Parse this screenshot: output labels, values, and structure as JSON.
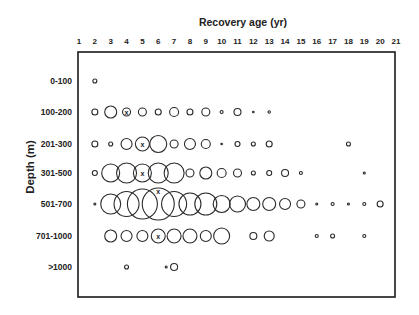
{
  "chart_data": {
    "type": "scatter",
    "subtype": "bubble",
    "title": "Recovery age (yr)",
    "xlabel": "Recovery age (yr)",
    "ylabel": "Depth (m)",
    "x_ticks": [
      "1",
      "2",
      "3",
      "4",
      "5",
      "6",
      "7",
      "8",
      "9",
      "10",
      "11",
      "12",
      "13",
      "14",
      "15",
      "16",
      "17",
      "18",
      "19",
      "20",
      "21"
    ],
    "xlim": [
      1,
      21
    ],
    "categories": [
      "0-100",
      "100-200",
      "201-300",
      "301-500",
      "501-700",
      "701-1000",
      ">1000"
    ],
    "grid": false,
    "legend": null,
    "size_unit": "approx. bubble diameter (px)",
    "marker_note": "x marks a highlighted bubble in several rows",
    "series": [
      {
        "name": "0-100",
        "points": [
          {
            "x": 2,
            "size": 4
          }
        ]
      },
      {
        "name": "100-200",
        "points": [
          {
            "x": 2,
            "size": 6
          },
          {
            "x": 3,
            "size": 12
          },
          {
            "x": 4,
            "size": 8,
            "marked": true
          },
          {
            "x": 5,
            "size": 8
          },
          {
            "x": 6,
            "size": 6
          },
          {
            "x": 7,
            "size": 9
          },
          {
            "x": 8,
            "size": 6
          },
          {
            "x": 9,
            "size": 8
          },
          {
            "x": 10,
            "size": 3
          },
          {
            "x": 11,
            "size": 7
          },
          {
            "x": 12,
            "size": 1.5
          },
          {
            "x": 13,
            "size": 2.5
          }
        ]
      },
      {
        "name": "201-300",
        "points": [
          {
            "x": 2,
            "size": 6
          },
          {
            "x": 3,
            "size": 4
          },
          {
            "x": 4,
            "size": 11
          },
          {
            "x": 5,
            "size": 14,
            "marked": true
          },
          {
            "x": 6,
            "size": 17
          },
          {
            "x": 7,
            "size": 8
          },
          {
            "x": 8,
            "size": 11
          },
          {
            "x": 9,
            "size": 9
          },
          {
            "x": 10,
            "size": 1.5
          },
          {
            "x": 11,
            "size": 5
          },
          {
            "x": 12,
            "size": 4
          },
          {
            "x": 13,
            "size": 6
          },
          {
            "x": 18,
            "size": 4
          }
        ]
      },
      {
        "name": "301-500",
        "points": [
          {
            "x": 2,
            "size": 5
          },
          {
            "x": 3,
            "size": 18
          },
          {
            "x": 4,
            "size": 20
          },
          {
            "x": 5,
            "size": 18,
            "marked": true
          },
          {
            "x": 6,
            "size": 20
          },
          {
            "x": 7,
            "size": 20
          },
          {
            "x": 8,
            "size": 8
          },
          {
            "x": 9,
            "size": 12
          },
          {
            "x": 10,
            "size": 9
          },
          {
            "x": 11,
            "size": 8
          },
          {
            "x": 12,
            "size": 4
          },
          {
            "x": 13,
            "size": 5
          },
          {
            "x": 14,
            "size": 7
          },
          {
            "x": 15,
            "size": 3
          },
          {
            "x": 19,
            "size": 2
          }
        ]
      },
      {
        "name": "501-700",
        "points": [
          {
            "x": 2,
            "size": 2
          },
          {
            "x": 3,
            "size": 20
          },
          {
            "x": 4,
            "size": 25
          },
          {
            "x": 5,
            "size": 30
          },
          {
            "x": 6,
            "size": 32,
            "marked": true,
            "mark_top": true
          },
          {
            "x": 7,
            "size": 25
          },
          {
            "x": 8,
            "size": 22
          },
          {
            "x": 9,
            "size": 22
          },
          {
            "x": 10,
            "size": 17
          },
          {
            "x": 11,
            "size": 16
          },
          {
            "x": 12,
            "size": 13
          },
          {
            "x": 13,
            "size": 13
          },
          {
            "x": 14,
            "size": 11
          },
          {
            "x": 15,
            "size": 8
          },
          {
            "x": 16,
            "size": 2
          },
          {
            "x": 17,
            "size": 3
          },
          {
            "x": 18,
            "size": 2
          },
          {
            "x": 19,
            "size": 3
          },
          {
            "x": 20,
            "size": 6
          }
        ]
      },
      {
        "name": "701-1000",
        "points": [
          {
            "x": 3,
            "size": 12
          },
          {
            "x": 4,
            "size": 11
          },
          {
            "x": 5,
            "size": 11
          },
          {
            "x": 6,
            "size": 14,
            "marked": true
          },
          {
            "x": 7,
            "size": 14
          },
          {
            "x": 8,
            "size": 14
          },
          {
            "x": 9,
            "size": 11
          },
          {
            "x": 10,
            "size": 16
          },
          {
            "x": 12,
            "size": 7
          },
          {
            "x": 13,
            "size": 10
          },
          {
            "x": 16,
            "size": 3
          },
          {
            "x": 17,
            "size": 4
          },
          {
            "x": 19,
            "size": 3
          }
        ]
      },
      {
        "name": ">1000",
        "points": [
          {
            "x": 4,
            "size": 4
          },
          {
            "x": 6.5,
            "size": 2
          },
          {
            "x": 7,
            "size": 7
          }
        ]
      }
    ]
  },
  "labels": {
    "title": "Recovery age (yr)",
    "y_axis_title": "Depth (m)",
    "mark_glyph": "x"
  },
  "colors": {
    "stroke": "#2a2a2a",
    "frame": "#1a1a1a",
    "background": "#ffffff"
  }
}
